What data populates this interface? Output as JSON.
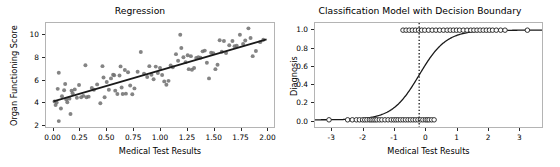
{
  "figure": {
    "width": 560,
    "height": 167,
    "background": "#ffffff",
    "panels": 2
  },
  "chart_data": [
    {
      "type": "scatter",
      "title": "Regression",
      "xlabel": "Medical Test Results",
      "ylabel": "Organ Functioning Score",
      "xlim": [
        -0.07,
        2.07
      ],
      "ylim": [
        1.75,
        11.1
      ],
      "xticks": [
        0.0,
        0.25,
        0.5,
        0.75,
        1.0,
        1.25,
        1.5,
        1.75,
        2.0
      ],
      "xticklabels": [
        "0.00",
        "0.25",
        "0.50",
        "0.75",
        "1.00",
        "1.25",
        "1.50",
        "1.75",
        "2.00"
      ],
      "yticks": [
        2,
        4,
        6,
        8,
        10
      ],
      "yticklabels": [
        "2",
        "4",
        "6",
        "8",
        "10"
      ],
      "grid": false,
      "legend": null,
      "marker_color": "#6e6e6e",
      "line_color": "#1a1a1a",
      "series": [
        {
          "name": "observations",
          "kind": "scatter",
          "points": [
            [
              0.01,
              4.05
            ],
            [
              0.02,
              3.72
            ],
            [
              0.03,
              3.95
            ],
            [
              0.04,
              5.18
            ],
            [
              0.05,
              2.28
            ],
            [
              0.05,
              6.62
            ],
            [
              0.07,
              3.42
            ],
            [
              0.08,
              4.52
            ],
            [
              0.1,
              5.05
            ],
            [
              0.11,
              5.62
            ],
            [
              0.12,
              4.22
            ],
            [
              0.13,
              3.98
            ],
            [
              0.15,
              4.3
            ],
            [
              0.16,
              2.92
            ],
            [
              0.17,
              5.02
            ],
            [
              0.18,
              4.78
            ],
            [
              0.2,
              5.13
            ],
            [
              0.22,
              4.38
            ],
            [
              0.24,
              5.52
            ],
            [
              0.26,
              4.42
            ],
            [
              0.28,
              4.55
            ],
            [
              0.3,
              7.3
            ],
            [
              0.31,
              4.42
            ],
            [
              0.33,
              4.48
            ],
            [
              0.36,
              5.25
            ],
            [
              0.38,
              5.1
            ],
            [
              0.41,
              5.58
            ],
            [
              0.44,
              3.88
            ],
            [
              0.46,
              7.22
            ],
            [
              0.47,
              6.2
            ],
            [
              0.48,
              4.42
            ],
            [
              0.5,
              5.8
            ],
            [
              0.52,
              5.1
            ],
            [
              0.54,
              6.12
            ],
            [
              0.56,
              6.45
            ],
            [
              0.57,
              6.4
            ],
            [
              0.58,
              5.02
            ],
            [
              0.6,
              4.72
            ],
            [
              0.62,
              6.38
            ],
            [
              0.63,
              7.2
            ],
            [
              0.64,
              5.3
            ],
            [
              0.65,
              4.72
            ],
            [
              0.67,
              6.88
            ],
            [
              0.68,
              4.75
            ],
            [
              0.7,
              6.68
            ],
            [
              0.72,
              5.48
            ],
            [
              0.74,
              4.7
            ],
            [
              0.76,
              5.22
            ],
            [
              0.79,
              6.72
            ],
            [
              0.82,
              8.5
            ],
            [
              0.85,
              6.55
            ],
            [
              0.88,
              6.25
            ],
            [
              0.9,
              7.22
            ],
            [
              0.92,
              6.45
            ],
            [
              0.94,
              6.05
            ],
            [
              0.96,
              7.18
            ],
            [
              0.98,
              6.6
            ],
            [
              1.0,
              7.05
            ],
            [
              1.02,
              6.42
            ],
            [
              1.04,
              5.85
            ],
            [
              1.06,
              5.55
            ],
            [
              1.08,
              5.9
            ],
            [
              1.1,
              7.28
            ],
            [
              1.12,
              7.12
            ],
            [
              1.15,
              8.3
            ],
            [
              1.17,
              7.7
            ],
            [
              1.19,
              10.05
            ],
            [
              1.2,
              8.85
            ],
            [
              1.22,
              8.02
            ],
            [
              1.24,
              7.58
            ],
            [
              1.26,
              8.2
            ],
            [
              1.27,
              6.95
            ],
            [
              1.29,
              8.12
            ],
            [
              1.3,
              6.9
            ],
            [
              1.32,
              7.05
            ],
            [
              1.34,
              7.95
            ],
            [
              1.36,
              8.02
            ],
            [
              1.38,
              7.98
            ],
            [
              1.4,
              8.55
            ],
            [
              1.42,
              8.62
            ],
            [
              1.44,
              7.52
            ],
            [
              1.46,
              6.12
            ],
            [
              1.48,
              8.42
            ],
            [
              1.5,
              8.38
            ],
            [
              1.52,
              6.95
            ],
            [
              1.54,
              7.35
            ],
            [
              1.56,
              9.55
            ],
            [
              1.58,
              8.52
            ],
            [
              1.6,
              9.48
            ],
            [
              1.62,
              8.4
            ],
            [
              1.65,
              9.1
            ],
            [
              1.68,
              9.48
            ],
            [
              1.7,
              9.02
            ],
            [
              1.72,
              9.05
            ],
            [
              1.75,
              10.05
            ],
            [
              1.78,
              9.22
            ],
            [
              1.8,
              9.52
            ],
            [
              1.83,
              10.62
            ],
            [
              1.85,
              9.75
            ],
            [
              1.87,
              8.12
            ],
            [
              1.9,
              8.58
            ],
            [
              1.94,
              9.38
            ],
            [
              1.97,
              9.6
            ]
          ]
        },
        {
          "name": "fitted-regression-line",
          "kind": "line",
          "points": [
            [
              0.0,
              4.05
            ],
            [
              2.0,
              9.62
            ]
          ]
        }
      ]
    },
    {
      "type": "line",
      "title": "Classification Model with Decision Boundary",
      "xlabel": "Medical Test Results",
      "ylabel": "Diagnosis",
      "xlim": [
        -3.55,
        3.75
      ],
      "ylim": [
        -0.08,
        1.08
      ],
      "xticks": [
        -3,
        -2,
        -1,
        0,
        1,
        2,
        3
      ],
      "xticklabels": [
        "-3",
        "-2",
        "-1",
        "0",
        "1",
        "2",
        "3"
      ],
      "yticks": [
        0.0,
        0.2,
        0.4,
        0.6,
        0.8,
        1.0
      ],
      "yticklabels": [
        "0.0",
        "0.2",
        "0.4",
        "0.6",
        "0.8",
        "1.0"
      ],
      "grid": false,
      "legend": null,
      "marker_color": "#ffffff",
      "marker_edge_color": "#1a1a1a",
      "line_color": "#1a1a1a",
      "decision_boundary": {
        "x": -0.2,
        "style": "dotted",
        "color": "#1a1a1a"
      },
      "sigmoid": {
        "midpoint": -0.2,
        "slope": 2.3,
        "note": "logistic curve 1/(1+exp(-slope*(x-midpoint)))"
      },
      "series": [
        {
          "name": "class-0-observations",
          "kind": "scatter",
          "y": 0.0,
          "x": [
            -3.1,
            -2.5,
            -2.35,
            -2.22,
            -2.12,
            -2.02,
            -1.95,
            -1.88,
            -1.8,
            -1.74,
            -1.68,
            -1.62,
            -1.56,
            -1.48,
            -1.4,
            -1.3,
            -1.2,
            -1.1,
            -1.02,
            -0.95,
            -0.88,
            -0.8,
            -0.72,
            -0.64,
            -0.56,
            -0.48,
            -0.4,
            -0.32,
            -0.24,
            -0.16,
            -0.08,
            0.0,
            0.06,
            0.12,
            0.2,
            0.28
          ]
        },
        {
          "name": "class-1-observations",
          "kind": "scatter",
          "y": 1.0,
          "x": [
            -0.72,
            -0.62,
            -0.52,
            -0.42,
            -0.32,
            -0.22,
            -0.12,
            -0.02,
            0.1,
            0.22,
            0.34,
            0.46,
            0.58,
            0.7,
            0.8,
            0.9,
            1.0,
            1.1,
            1.22,
            1.34,
            1.46,
            1.56,
            1.66,
            1.76,
            1.86,
            1.96,
            2.06,
            2.16,
            2.28,
            2.42,
            2.56,
            3.28
          ]
        }
      ]
    }
  ],
  "panel_left": {
    "title": "Regression",
    "xlabel": "Medical Test Results",
    "ylabel": "Organ Functioning Score",
    "xticklabels": [
      "0.00",
      "0.25",
      "0.50",
      "0.75",
      "1.00",
      "1.25",
      "1.50",
      "1.75",
      "2.00"
    ],
    "yticklabels": [
      "2",
      "4",
      "6",
      "8",
      "10"
    ]
  },
  "panel_right": {
    "title": "Classification Model with Decision Boundary",
    "xlabel": "Medical Test Results",
    "ylabel": "Diagnosis",
    "xticklabels": [
      "-3",
      "-2",
      "-1",
      "0",
      "1",
      "2",
      "3"
    ],
    "yticklabels": [
      "0.0",
      "0.2",
      "0.4",
      "0.6",
      "0.8",
      "1.0"
    ]
  }
}
